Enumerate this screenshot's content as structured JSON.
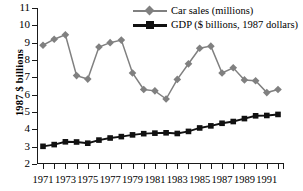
{
  "chart_data": {
    "type": "line",
    "title": "",
    "xlabel": "",
    "ylabel": "1987 $ billions",
    "ylim": [
      2,
      11
    ],
    "yticks": [
      2,
      3,
      4,
      5,
      6,
      7,
      8,
      9,
      10,
      11
    ],
    "xlim": [
      1971,
      1992
    ],
    "x": [
      1971,
      1972,
      1973,
      1974,
      1975,
      1976,
      1977,
      1978,
      1979,
      1980,
      1981,
      1982,
      1983,
      1984,
      1985,
      1986,
      1987,
      1988,
      1989,
      1990,
      1991,
      1992
    ],
    "xticks": [
      1971,
      1972,
      1973,
      1974,
      1975,
      1976,
      1977,
      1978,
      1979,
      1980,
      1981,
      1982,
      1983,
      1984,
      1985,
      1986,
      1987,
      1988,
      1989,
      1990,
      1991,
      1992
    ],
    "xtick_labels": [
      "1971",
      "",
      "1973",
      "",
      "1975",
      "",
      "1977",
      "",
      "1979",
      "",
      "1981",
      "",
      "1983",
      "",
      "1985",
      "",
      "1987",
      "",
      "1989",
      "",
      "1991",
      ""
    ],
    "grid": false,
    "legend_position": "top-right",
    "series": [
      {
        "name": "Car sales (millions)",
        "marker": "diamond",
        "color": "#808080",
        "values": [
          8.85,
          9.2,
          9.45,
          7.1,
          6.9,
          8.75,
          9.0,
          9.15,
          7.25,
          6.3,
          6.22,
          5.75,
          6.88,
          7.78,
          8.68,
          8.8,
          7.25,
          7.55,
          6.85,
          6.8,
          6.12,
          6.3
        ]
      },
      {
        "name": "GDP ($ billions, 1987 dollars)",
        "marker": "square",
        "color": "#111111",
        "values": [
          3.02,
          3.12,
          3.28,
          3.27,
          3.2,
          3.38,
          3.5,
          3.58,
          3.68,
          3.75,
          3.78,
          3.8,
          3.76,
          3.88,
          4.08,
          4.2,
          4.35,
          4.45,
          4.62,
          4.78,
          4.8,
          4.72
        ]
      }
    ],
    "series_last_point_override": {
      "GDP ($ billions, 1987 dollars)": 4.86
    }
  },
  "legend": {
    "items": [
      {
        "label": "Car sales (millions)",
        "marker": "diamond",
        "color": "#808080"
      },
      {
        "label": "GDP ($ billions, 1987 dollars)",
        "marker": "square",
        "color": "#111111"
      }
    ]
  },
  "axes": {
    "y_title": "1987 $ billions",
    "y_tick_labels": [
      "11",
      "10",
      "9",
      "8",
      "7",
      "6",
      "5",
      "4",
      "3",
      "2"
    ],
    "x_tick_labels": [
      "1971",
      "1973",
      "1975",
      "1977",
      "1979",
      "1981",
      "1983",
      "1985",
      "1987",
      "1989",
      "1991"
    ]
  },
  "caption_sliver": ""
}
